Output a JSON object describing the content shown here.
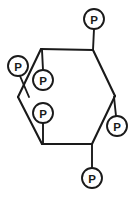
{
  "diagram": {
    "background_color": "#ffffff",
    "line_color": "#1a1a1a",
    "circle_fill_color": "#ffffff",
    "ring": {
      "name": "cyclohexane-ring",
      "vertex_count": 6,
      "vertices": [
        {
          "id": "v-top-left",
          "x": 41,
          "y": 49
        },
        {
          "id": "v-top-right",
          "x": 93,
          "y": 50
        },
        {
          "id": "v-right",
          "x": 115,
          "y": 96
        },
        {
          "id": "v-bottom-right",
          "x": 92,
          "y": 144
        },
        {
          "id": "v-bottom-left",
          "x": 42,
          "y": 144
        },
        {
          "id": "v-left",
          "x": 18,
          "y": 97
        }
      ],
      "edges": [
        [
          "v-top-left",
          "v-top-right"
        ],
        [
          "v-top-right",
          "v-right"
        ],
        [
          "v-right",
          "v-bottom-right"
        ],
        [
          "v-bottom-right",
          "v-bottom-left"
        ],
        [
          "v-bottom-left",
          "v-left"
        ],
        [
          "v-left",
          "v-top-left"
        ]
      ]
    },
    "substituents": [
      {
        "id": "p-top",
        "label": "P",
        "orientation": "axial-up",
        "circle": {
          "cx": 94,
          "cy": 19,
          "r": 10
        },
        "bond": {
          "x1": 94,
          "y1": 29,
          "x2": 93,
          "y2": 50
        },
        "attached_to": "v-top-right"
      },
      {
        "id": "p-upper-left",
        "label": "P",
        "orientation": "equatorial-left",
        "circle": {
          "cx": 18,
          "cy": 66,
          "r": 10
        },
        "bond": {
          "x1": 20,
          "y1": 76,
          "x2": 29,
          "y2": 97
        },
        "attached_to": "v-left"
      },
      {
        "id": "p-inner-upper",
        "label": "P",
        "orientation": "axial-up-inner",
        "circle": {
          "cx": 43,
          "cy": 80,
          "r": 10
        },
        "bond": {
          "x1": 43,
          "y1": 70,
          "x2": 42,
          "y2": 50
        },
        "attached_to": "v-top-left"
      },
      {
        "id": "p-inner-lower",
        "label": "P",
        "orientation": "axial-down-inner",
        "circle": {
          "cx": 43,
          "cy": 113,
          "r": 10
        },
        "bond": {
          "x1": 43,
          "y1": 123,
          "x2": 43,
          "y2": 143
        },
        "attached_to": "v-bottom-left"
      },
      {
        "id": "p-right",
        "label": "P",
        "orientation": "equatorial-right",
        "circle": {
          "cx": 117,
          "cy": 126,
          "r": 10
        },
        "bond": {
          "x1": 116,
          "y1": 116,
          "x2": 114,
          "y2": 97
        },
        "attached_to": "v-right"
      },
      {
        "id": "p-bottom",
        "label": "P",
        "orientation": "axial-down",
        "circle": {
          "cx": 92,
          "cy": 178,
          "r": 10
        },
        "bond": {
          "x1": 92,
          "y1": 168,
          "x2": 92,
          "y2": 145
        },
        "attached_to": "v-bottom-right"
      }
    ]
  }
}
